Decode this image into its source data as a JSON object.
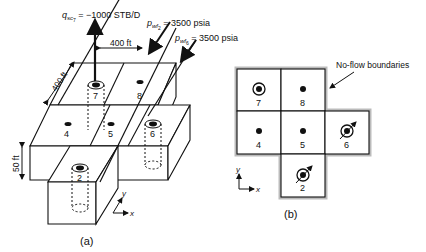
{
  "panel_a": {
    "caption": "(a)",
    "rate_label": {
      "symbol": "q",
      "sub": "sc",
      "subsub": "7",
      "value": " = −1000 STB/D"
    },
    "pwf2_label": {
      "symbol": "p",
      "sub": "wf",
      "subsub": "2",
      "value": " = 3500 psia"
    },
    "pwf6_label": {
      "symbol": "p",
      "sub": "wf",
      "subsub": "6",
      "value": " = 3500 psia"
    },
    "dim_x": "400 ft",
    "dim_y": "400 ft",
    "dim_z": "50 ft",
    "blocks": [
      "7",
      "8",
      "4",
      "5",
      "6",
      "2"
    ],
    "axis_x": "x",
    "axis_y": "y"
  },
  "panel_b": {
    "caption": "(b)",
    "annotation": "No-flow boundaries",
    "blocks": [
      {
        "id": "7",
        "well": "injector"
      },
      {
        "id": "8",
        "well": "none"
      },
      {
        "id": "4",
        "well": "none"
      },
      {
        "id": "5",
        "well": "none"
      },
      {
        "id": "6",
        "well": "producer"
      },
      {
        "id": "2",
        "well": "producer"
      }
    ],
    "axis_x": "x",
    "axis_y": "y"
  }
}
